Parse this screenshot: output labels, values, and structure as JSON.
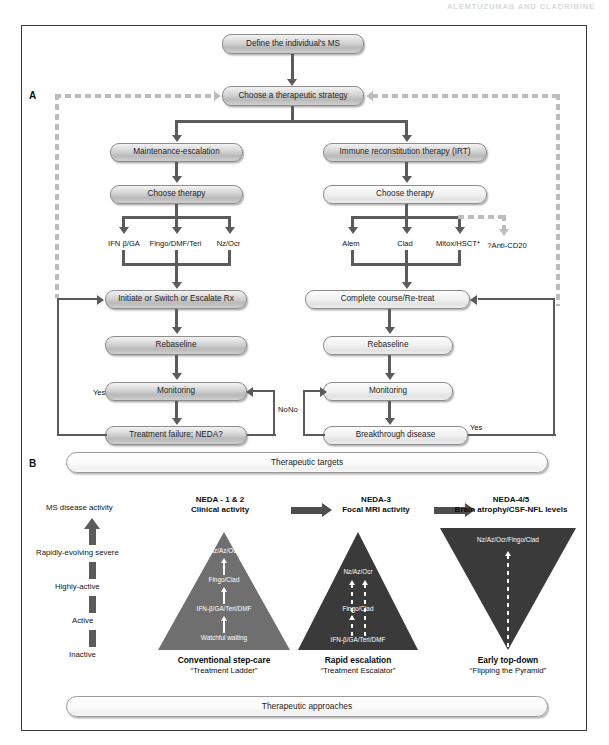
{
  "header": {
    "running_title": "ALEMTUZUMAB AND CLADRIBINE"
  },
  "panels": {
    "a_letter": "A",
    "b_letter": "B"
  },
  "flow": {
    "root": "Define the individual's MS",
    "strategy": "Choose a therapeutic strategy",
    "left_branch": {
      "strategy_name": "Maintenance-escalation",
      "choose": "Choose therapy",
      "drugs": [
        "IFN β/GA",
        "Fingo/DMF/Teri",
        "Nz/Ocr"
      ],
      "steps": [
        "Initiate or Switch or Escalate Rx",
        "Rebaseline",
        "Monitoring",
        "Treatment failure; NEDA?"
      ],
      "loop_yes": "Yes",
      "loop_no": "No"
    },
    "right_branch": {
      "strategy_name": "Immune reconstitution therapy (IRT)",
      "choose": "Choose therapy",
      "drugs": [
        "Alem",
        "Clad",
        "Mitox/HSCT*"
      ],
      "dashed_drug": "?Anti-CD20",
      "steps": [
        "Complete course/Re-treat",
        "Rebaseline",
        "Monitoring",
        "Breakthrough disease"
      ],
      "loop_yes": "Yes",
      "loop_no": "No"
    }
  },
  "targets": {
    "top_bar": "Therapeutic targets",
    "bottom_bar": "Therapeutic approaches",
    "stages": [
      {
        "title": "NEDA - 1 & 2",
        "subtitle": "Clinical activity"
      },
      {
        "title": "NEDA-3",
        "subtitle": "Focal MRI activity"
      },
      {
        "title": "NEDA-4/5",
        "subtitle": "Brain atrophy/CSF-NFL levels"
      }
    ]
  },
  "severity_axis": {
    "axis_title": "MS disease activity",
    "levels": [
      "Rapidly-evolving severe",
      "Highly-active",
      "Active",
      "Inactive"
    ]
  },
  "pyramids": [
    {
      "id": "conventional",
      "orientation": "up",
      "fill": "#6f6f6f",
      "tiers": [
        "Nz/Az/Ocr",
        "Fingo/Clad",
        "IFN-β/GA/Teri/DMF",
        "Watchful waiting"
      ],
      "arrow_style": "solid",
      "caption_title": "Conventional step-care",
      "caption_sub": "“Treatment Ladder”"
    },
    {
      "id": "rapid",
      "orientation": "up",
      "fill": "#3a3a3a",
      "tiers": [
        "Nz/Az/Ocr",
        "Fingo/Clad",
        "IFN-β/GA/Teri/DMF"
      ],
      "arrow_style": "dashed-double",
      "caption_title": "Rapid escalation",
      "caption_sub": "“Treatment Escalator”"
    },
    {
      "id": "topdown",
      "orientation": "down",
      "fill": "#3a3a3a",
      "tiers": [
        "Nz/Az/Ocr/Fingo/Clad"
      ],
      "arrow_style": "dashed-up",
      "caption_title": "Early top-down",
      "caption_sub": "“Flipping the Pyramid”"
    }
  ]
}
